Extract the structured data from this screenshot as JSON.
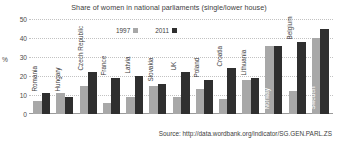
{
  "chart_data": {
    "type": "bar",
    "title": "Share of women in national parliaments (single/lower house)",
    "xlabel": "",
    "ylabel": "%",
    "ylim": [
      0,
      50
    ],
    "yticks": [
      0,
      10,
      20,
      30,
      40,
      50
    ],
    "grid": true,
    "legend_position": "top-center",
    "categories": [
      "Romania",
      "Hungary",
      "Czech Republic",
      "France",
      "Latvia",
      "Slovakia",
      "UK",
      "Poland",
      "Croatia",
      "Lithuania",
      "Norway",
      "Belgium",
      "Sweden"
    ],
    "series": [
      {
        "name": "1997",
        "color": "#a8a8a8",
        "values": [
          7,
          11,
          15,
          6,
          9,
          15,
          9,
          13,
          8,
          18,
          36,
          12,
          40
        ]
      },
      {
        "name": "2011",
        "color": "#2f2f2f",
        "values": [
          11,
          9,
          22,
          19,
          20,
          16,
          22,
          18,
          24,
          19,
          36,
          38,
          45
        ]
      }
    ],
    "label_on_bar": [
      false,
      false,
      false,
      false,
      false,
      false,
      false,
      false,
      false,
      false,
      true,
      false,
      true
    ]
  },
  "source": {
    "text": "Source: http://data.wordbank.org/indicator/SG.GEN.PARL.ZS"
  }
}
